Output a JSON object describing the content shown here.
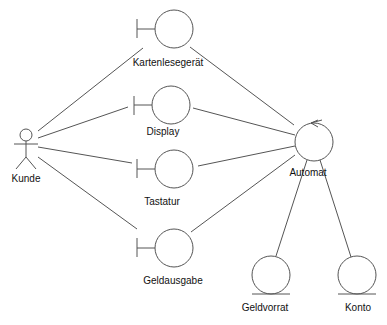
{
  "diagram": {
    "type": "UML robustness diagram",
    "colors": {
      "stroke": "#555555",
      "text": "#111111",
      "background": "#ffffff"
    },
    "actor": {
      "id": "kunde",
      "label": "Kunde",
      "icon": "stick-figure-icon"
    },
    "boundaries": [
      {
        "id": "kartenlesegeraet",
        "label": "Kartenlesegerät",
        "icon": "boundary-icon"
      },
      {
        "id": "display",
        "label": "Display",
        "icon": "boundary-icon"
      },
      {
        "id": "tastatur",
        "label": "Tastatur",
        "icon": "boundary-icon"
      },
      {
        "id": "geldausgabe",
        "label": "Geldausgabe",
        "icon": "boundary-icon"
      }
    ],
    "controls": [
      {
        "id": "automat",
        "label": "Automat",
        "icon": "control-icon"
      }
    ],
    "entities": [
      {
        "id": "geldvorrat",
        "label": "Geldvorrat",
        "icon": "entity-icon"
      },
      {
        "id": "konto",
        "label": "Konto",
        "icon": "entity-icon"
      }
    ],
    "connections": [
      {
        "from": "Kunde",
        "to": "Kartenlesegerät"
      },
      {
        "from": "Kunde",
        "to": "Display"
      },
      {
        "from": "Kunde",
        "to": "Tastatur"
      },
      {
        "from": "Kunde",
        "to": "Geldausgabe"
      },
      {
        "from": "Kartenlesegerät",
        "to": "Automat"
      },
      {
        "from": "Display",
        "to": "Automat"
      },
      {
        "from": "Tastatur",
        "to": "Automat"
      },
      {
        "from": "Geldausgabe",
        "to": "Automat"
      },
      {
        "from": "Automat",
        "to": "Geldvorrat"
      },
      {
        "from": "Automat",
        "to": "Konto"
      }
    ]
  }
}
